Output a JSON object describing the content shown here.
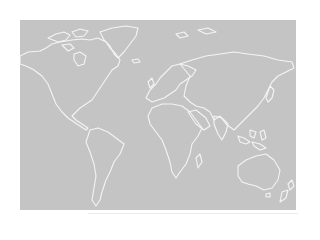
{
  "map": {
    "title": "",
    "type": "world-outline",
    "projection": "equirectangular",
    "colors": {
      "ocean_land_fill": "#c4c4c4",
      "coastline": "#f4f4f4",
      "background": "#ffffff"
    },
    "regions": [
      "North America",
      "Greenland",
      "South America",
      "Europe",
      "Africa",
      "Asia",
      "Australia",
      "New Zealand",
      "Antarctica-none"
    ]
  }
}
